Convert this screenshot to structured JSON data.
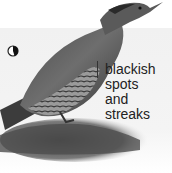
{
  "image": {
    "subject": "woodpecker illustration",
    "annotation": {
      "lines": [
        "blackish",
        "spots",
        "and",
        "streaks"
      ]
    },
    "icon": "moon-phase-icon"
  }
}
